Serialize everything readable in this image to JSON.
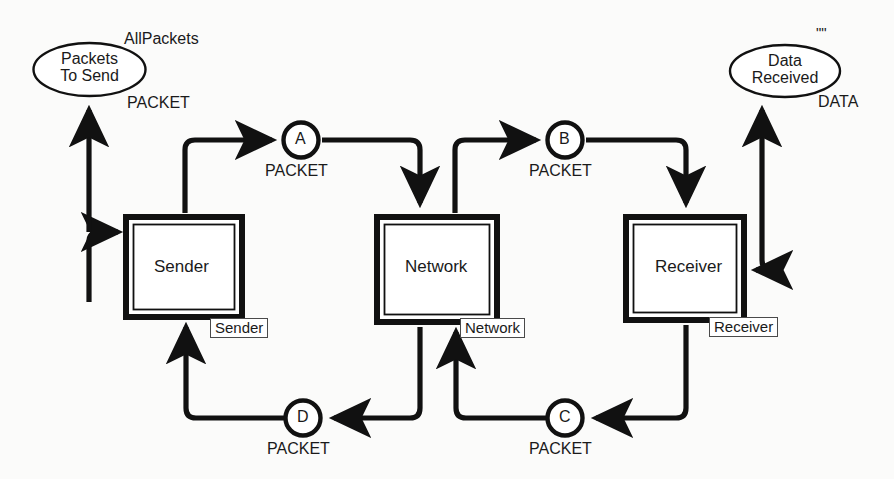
{
  "diagram": {
    "background_color": "#fbfbfa",
    "line_color": "#111111"
  },
  "places": [
    {
      "id": "packets-to-send",
      "line1": "Packets",
      "line2": "To Send",
      "marking_label": "AllPackets",
      "colorset_label": "PACKET",
      "shape": "ellipse"
    },
    {
      "id": "data-received",
      "line1": "Data",
      "line2": "Received",
      "marking_label": "\"\"",
      "colorset_label": "DATA",
      "shape": "ellipse"
    },
    {
      "id": "place-a",
      "label": "A",
      "colorset_label": "PACKET",
      "shape": "circle"
    },
    {
      "id": "place-b",
      "label": "B",
      "colorset_label": "PACKET",
      "shape": "circle"
    },
    {
      "id": "place-c",
      "label": "C",
      "colorset_label": "PACKET",
      "shape": "circle"
    },
    {
      "id": "place-d",
      "label": "D",
      "colorset_label": "PACKET",
      "shape": "circle"
    }
  ],
  "transitions": [
    {
      "id": "sender",
      "label": "Sender",
      "tag": "Sender"
    },
    {
      "id": "network",
      "label": "Network",
      "tag": "Network"
    },
    {
      "id": "receiver",
      "label": "Receiver",
      "tag": "Receiver"
    }
  ],
  "arcs": [
    {
      "from": "packets-to-send",
      "to": "sender",
      "direction": "bidirectional"
    },
    {
      "from": "sender",
      "to": "place-a",
      "direction": "forward"
    },
    {
      "from": "place-a",
      "to": "network",
      "direction": "forward"
    },
    {
      "from": "network",
      "to": "place-b",
      "direction": "forward"
    },
    {
      "from": "place-b",
      "to": "receiver",
      "direction": "forward"
    },
    {
      "from": "receiver",
      "to": "data-received",
      "direction": "bidirectional"
    },
    {
      "from": "receiver",
      "to": "place-c",
      "direction": "forward"
    },
    {
      "from": "place-c",
      "to": "network",
      "direction": "forward"
    },
    {
      "from": "network",
      "to": "place-d",
      "direction": "forward"
    },
    {
      "from": "place-d",
      "to": "sender",
      "direction": "forward"
    }
  ]
}
